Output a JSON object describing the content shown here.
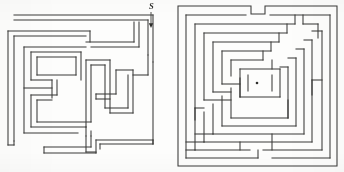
{
  "figure": {
    "background_color": "#fdfdfc",
    "ink_color": "#3a3a38",
    "width": 344,
    "height": 172,
    "panel_count": 2
  },
  "left_maze": {
    "name": "rectilinear-maze",
    "description": "Hand-drawn rectangular maze with winding corridors",
    "entrance_label": "S",
    "entrance_label_x": 151,
    "entrance_label_y": 9,
    "arrow": {
      "name": "entrance-arrow",
      "direction": "down",
      "x": 151,
      "y_start": 12,
      "y_end": 27
    },
    "bounds": {
      "x": 6,
      "y": 12,
      "width": 152,
      "height": 154
    },
    "ink_color": "#3a3a38",
    "stroke_width": 1.05
  },
  "right_maze": {
    "name": "concentric-labyrinth",
    "description": "Square concentric labyrinth with a dot marking the center goal",
    "bounds": {
      "x": 176,
      "y": 4,
      "width": 163,
      "height": 164
    },
    "center_dot": {
      "x": 257,
      "y": 83,
      "radius": 1.3
    },
    "ink_color": "#3a3a38",
    "stroke_width": 1.05,
    "ring_count": 7
  }
}
